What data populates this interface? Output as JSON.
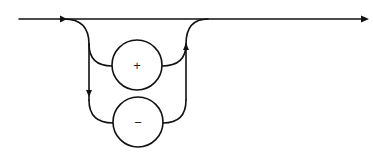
{
  "diagram": {
    "type": "syntax-railroad-diagram",
    "colors": {
      "stroke": "#111111",
      "background": "#ffffff"
    },
    "nodes": [
      {
        "id": "plus",
        "label": "+"
      },
      {
        "id": "minus",
        "label": "−"
      }
    ],
    "paths": [
      {
        "from": "entry",
        "to": "exit",
        "label": "bypass"
      },
      {
        "from": "entry",
        "to": "plus"
      },
      {
        "from": "entry",
        "to": "minus"
      },
      {
        "from": "plus",
        "to": "exit"
      },
      {
        "from": "minus",
        "to": "exit"
      }
    ]
  }
}
